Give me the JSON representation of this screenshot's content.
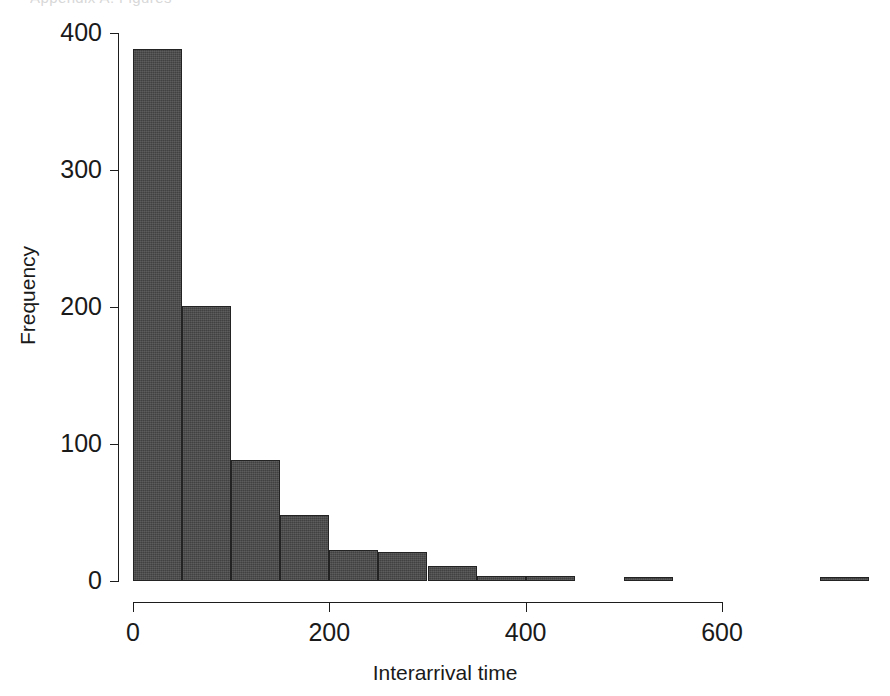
{
  "figure": {
    "clipped_caption": "Appendix A: Figures",
    "background_color": "#ffffff"
  },
  "chart_data": {
    "type": "bar",
    "subtype": "histogram",
    "title": "",
    "xlabel": "Interarrival time",
    "ylabel": "Frequency",
    "bar_color": "#4a4a4a",
    "bar_edge_color": "#232323",
    "grid": false,
    "legend": null,
    "xlim": [
      0,
      750
    ],
    "ylim": [
      0,
      400
    ],
    "xticks": [
      0,
      200,
      400,
      600
    ],
    "xtick_labels": [
      "0",
      "200",
      "400",
      "600"
    ],
    "yticks": [
      0,
      100,
      200,
      300,
      400
    ],
    "ytick_labels": [
      "0",
      "100",
      "200",
      "300",
      "400"
    ],
    "bin_width": 50,
    "bin_edges": [
      0,
      50,
      100,
      150,
      200,
      250,
      300,
      350,
      400,
      450,
      500,
      550,
      600,
      650,
      700,
      750
    ],
    "categories": [
      "0-50",
      "50-100",
      "100-150",
      "150-200",
      "200-250",
      "250-300",
      "300-350",
      "350-400",
      "400-450",
      "450-500",
      "500-550",
      "550-600",
      "600-650",
      "650-700",
      "700-750"
    ],
    "bin_centers": [
      25,
      75,
      125,
      175,
      225,
      275,
      325,
      375,
      425,
      475,
      525,
      575,
      625,
      675,
      725
    ],
    "values": [
      388,
      201,
      88,
      48,
      23,
      21,
      11,
      4,
      4,
      0,
      3,
      0,
      0,
      0,
      3
    ]
  }
}
